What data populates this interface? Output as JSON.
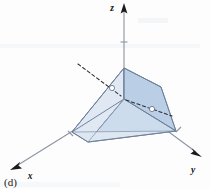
{
  "figure": {
    "caption": "(d)",
    "kind": "3d-coordinate-solid-diagram",
    "background_color": "#fdfdfd"
  },
  "axes": {
    "z": {
      "label": "z",
      "label_position": "top-center",
      "direction": "up",
      "arrow": "up-arrowhead",
      "tick_count": 1
    },
    "y": {
      "label": "y",
      "label_position": "bottom-right",
      "direction": "down-right",
      "arrow": "down-right-arrowhead",
      "tick_count": 1
    },
    "x": {
      "label": "x",
      "label_position": "bottom-left",
      "direction": "down-left",
      "arrow": "down-left-arrowhead",
      "tick_count": 1
    }
  },
  "solid": {
    "name": "shaded-solid-region",
    "face_colors": {
      "top_left_face": "#d5e1ef",
      "top_right_face": "#c3d5e8",
      "front_right_face": "#b9cee4",
      "front_left_face": "#e2eaf3",
      "bottom_face": "#dfe8f2"
    },
    "edge_color": "#6d7d96",
    "hidden_edge_style": "dashed",
    "vertex_marker_color": "#ffffff"
  },
  "colors": {
    "axis": "#8e94a3",
    "arrowhead": "#1b1b1b",
    "dashed_line": "#2b2b33",
    "label_text": "#111111",
    "caption_text": "#1a1a1a"
  }
}
